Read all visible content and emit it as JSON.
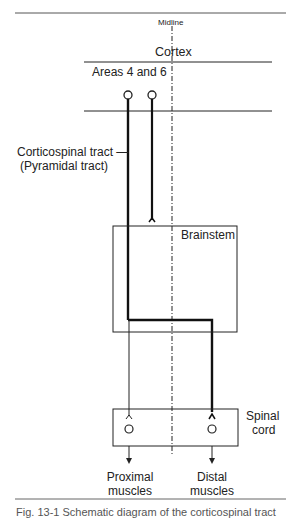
{
  "diagram": {
    "midline_label": "Midline",
    "cortex_label": "Cortex",
    "areas_label": "Areas 4 and 6",
    "tract_label_line1": "Corticospinal tract —",
    "tract_label_line2": "(Pyramidal tract)",
    "brainstem_label": "Brainstem",
    "spinal_label_line1": "Spinal",
    "spinal_label_line2": "cord",
    "proximal_line1": "Proximal",
    "proximal_line2": "muscles",
    "distal_line1": "Distal",
    "distal_line2": "muscles",
    "caption": "Fig. 13-1 Schematic diagram of the corticospinal tract"
  }
}
